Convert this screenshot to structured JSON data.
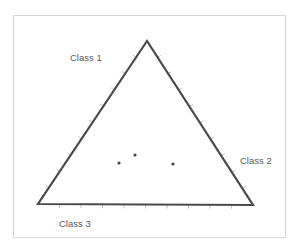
{
  "diagram": {
    "type": "ternary",
    "vertex_labels": {
      "top": "Class 1",
      "right": "Class 2",
      "bottom_left": "Class 3"
    },
    "colors": {
      "triangle_stroke": "#4a4a4a",
      "tick_stroke": "#b8b8b8",
      "point_fill": "#444444",
      "frame_border": "#d6d6d6",
      "label_text": "#5a5a5a"
    },
    "vertices": {
      "top": [
        147,
        41
      ],
      "bottom_left": [
        38,
        204
      ],
      "bottom_right": [
        253,
        205
      ]
    },
    "ticks_per_side": 10,
    "points": [
      {
        "x": 119,
        "y": 163
      },
      {
        "x": 135,
        "y": 155
      },
      {
        "x": 173,
        "y": 164
      }
    ]
  }
}
